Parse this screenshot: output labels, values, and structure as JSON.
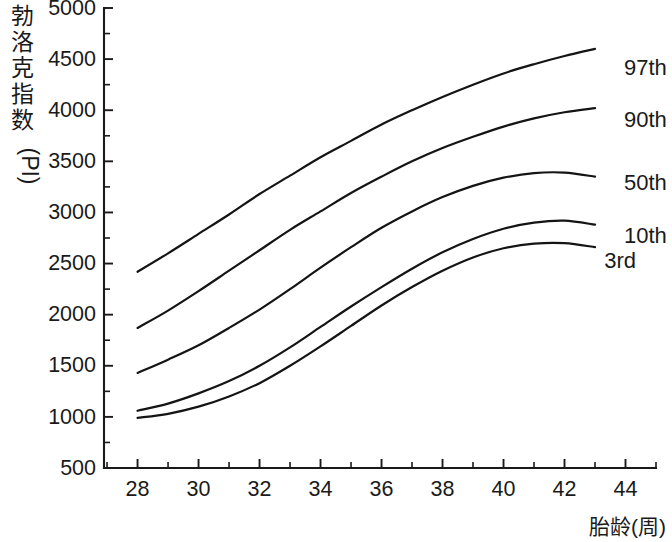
{
  "chart_data": {
    "type": "line",
    "title": "",
    "xlabel": "胎龄(周)",
    "ylabel_cjk": "勃洛克指数",
    "ylabel_latin": "(PI)",
    "ylabel_full": "勃洛克指数 (PI)",
    "xlim": [
      26.9,
      45.0
    ],
    "ylim": [
      500,
      5000
    ],
    "x_ticks_major": [
      28,
      30,
      32,
      34,
      36,
      38,
      40,
      42,
      44
    ],
    "x_ticks_major_labels": [
      "28",
      "30",
      "32",
      "34",
      "36",
      "38",
      "40",
      "42",
      "44"
    ],
    "x_tick_minor_step": 1,
    "y_ticks_major": [
      500,
      1000,
      1500,
      2000,
      2500,
      3000,
      3500,
      4000,
      4500,
      5000
    ],
    "y_ticks_major_labels": [
      "500",
      "1000",
      "1500",
      "2000",
      "2500",
      "3000",
      "3500",
      "4000",
      "4500",
      "5000"
    ],
    "y_tick_minor_step": 250,
    "grid": false,
    "legend_position": "right-inline-labels",
    "line_color": "#141414",
    "axis_color": "#1a1a1a",
    "background": "#ffffff",
    "x": [
      28,
      29,
      30,
      31,
      32,
      33,
      34,
      35,
      36,
      37,
      38,
      39,
      40,
      41,
      42,
      43
    ],
    "series": [
      {
        "name": "97th",
        "label": "97th",
        "values": [
          2420,
          2600,
          2790,
          2980,
          3180,
          3360,
          3540,
          3700,
          3860,
          4000,
          4130,
          4250,
          4360,
          4450,
          4530,
          4600
        ]
      },
      {
        "name": "90th",
        "label": "90th",
        "values": [
          1870,
          2040,
          2230,
          2430,
          2630,
          2830,
          3010,
          3190,
          3350,
          3500,
          3630,
          3740,
          3840,
          3920,
          3980,
          4020
        ]
      },
      {
        "name": "50th",
        "label": "50th",
        "values": [
          1430,
          1560,
          1700,
          1870,
          2050,
          2250,
          2460,
          2660,
          2850,
          3010,
          3150,
          3260,
          3340,
          3385,
          3390,
          3350
        ]
      },
      {
        "name": "10th",
        "label": "10th",
        "values": [
          1060,
          1130,
          1230,
          1350,
          1500,
          1680,
          1880,
          2080,
          2270,
          2450,
          2610,
          2740,
          2840,
          2900,
          2920,
          2880
        ]
      },
      {
        "name": "3rd",
        "label": "3rd",
        "values": [
          990,
          1030,
          1100,
          1200,
          1330,
          1500,
          1690,
          1890,
          2090,
          2270,
          2430,
          2560,
          2650,
          2695,
          2700,
          2660
        ]
      }
    ]
  }
}
